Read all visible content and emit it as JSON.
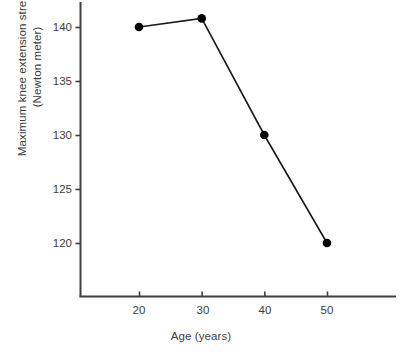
{
  "chart_data": {
    "type": "line",
    "title": "",
    "subtitle": "",
    "xlabel": "Age (years)",
    "ylabel": "Maximum knee extension strength",
    "ylabel_line2": "(Newton meter)",
    "ylabel_full": "Maximum knee extension strength (Newton meter)",
    "x": [
      20,
      30,
      40,
      50
    ],
    "values": [
      140.0,
      140.8,
      130.0,
      120.0
    ],
    "series": [
      {
        "name": "Maximum knee extension strength",
        "values": [
          140.0,
          140.8,
          130.0,
          120.0
        ]
      }
    ],
    "xticks": [
      "20",
      "30",
      "40",
      "50"
    ],
    "xtick_values": [
      20,
      30,
      40,
      50
    ],
    "yticks": [
      "120",
      "125",
      "130",
      "135",
      "140"
    ],
    "ytick_values": [
      120,
      125,
      130,
      135,
      140
    ],
    "xlim": [
      12.5,
      60.8
    ],
    "ylim": [
      115,
      142.5
    ],
    "grid": false,
    "legend": false,
    "legend_position": "none",
    "marker": "filled-circle",
    "line_color": "#1a1a1a",
    "marker_color": "#000000",
    "axis_color": "#3f3f3f",
    "text_color": "#3d3d3d",
    "background": "#ffffff",
    "annotations": []
  },
  "figure": {
    "caption_ghost": ""
  }
}
